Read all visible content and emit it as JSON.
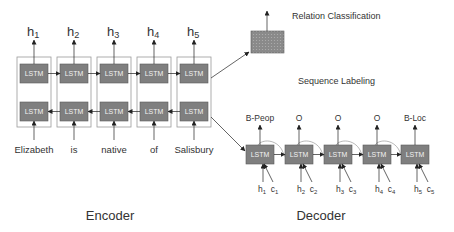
{
  "encoder": {
    "title": "Encoder",
    "cell_label": "LSTM",
    "outputs": [
      {
        "base": "h",
        "sub": "1"
      },
      {
        "base": "h",
        "sub": "2"
      },
      {
        "base": "h",
        "sub": "3"
      },
      {
        "base": "h",
        "sub": "4"
      },
      {
        "base": "h",
        "sub": "5"
      }
    ],
    "inputs": [
      "Elizabeth",
      "is",
      "native",
      "of",
      "Salisbury"
    ]
  },
  "decoder": {
    "title": "Decoder",
    "cell_label": "LSTM",
    "tags": [
      "B-Peop",
      "O",
      "O",
      "O",
      "B-Loc"
    ],
    "inputs": [
      {
        "h": "h",
        "h_sub": "1",
        "c": "c",
        "c_sub": "1"
      },
      {
        "h": "h",
        "h_sub": "2",
        "c": "c",
        "c_sub": "2"
      },
      {
        "h": "h",
        "h_sub": "3",
        "c": "c",
        "c_sub": "3"
      },
      {
        "h": "h",
        "h_sub": "4",
        "c": "c",
        "c_sub": "4"
      },
      {
        "h": "h",
        "h_sub": "5",
        "c": "c",
        "c_sub": "5"
      }
    ]
  },
  "tasks": {
    "relation_classification": "Relation Classification",
    "sequence_labeling": "Sequence Labeling"
  },
  "colors": {
    "cell_fill": "#7f7f7f",
    "cell_border": "#5a5a5a",
    "frame_border": "#9a9a9a",
    "arrow": "#222222",
    "classifier_fill": "#8c8c8c"
  }
}
